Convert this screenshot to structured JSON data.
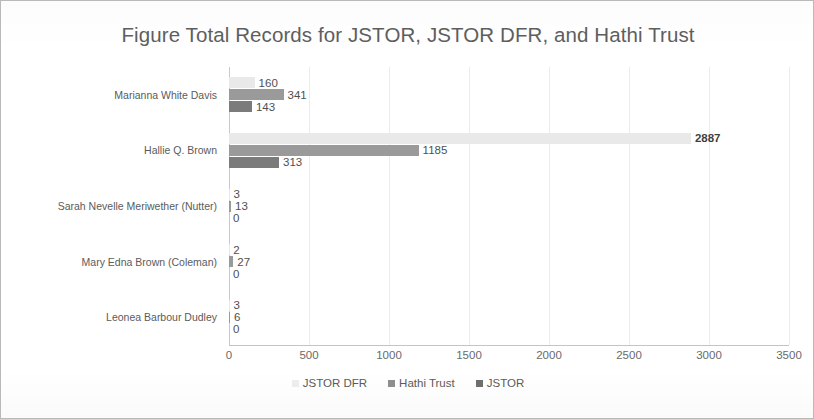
{
  "chart_data": {
    "type": "bar",
    "orientation": "horizontal",
    "title": "Figure Total Records for JSTOR, JSTOR DFR, and Hathi Trust",
    "xlabel": "",
    "ylabel": "",
    "xlim": [
      0,
      3500
    ],
    "xticks": [
      0,
      500,
      1000,
      1500,
      2000,
      2500,
      3000,
      3500
    ],
    "xtick_labels": [
      "0",
      "500",
      "1000",
      "1500",
      "2000",
      "2500",
      "3000",
      "3500"
    ],
    "grid": true,
    "legend_position": "bottom",
    "categories": [
      "Marianna White Davis",
      "Hallie Q. Brown",
      "Sarah Nevelle Meriwether (Nutter)",
      "Mary Edna Brown (Coleman)",
      "Leonea Barbour Dudley"
    ],
    "series": [
      {
        "name": "JSTOR DFR",
        "color": "#e9e9e9",
        "values": [
          160,
          2887,
          3,
          2,
          3
        ],
        "labels": [
          "160",
          "2887",
          "3",
          "2",
          "3"
        ]
      },
      {
        "name": "Hathi Trust",
        "color": "#9a9a9a",
        "values": [
          341,
          1185,
          13,
          27,
          6
        ],
        "labels": [
          "341",
          "1185",
          "13",
          "27",
          "6"
        ]
      },
      {
        "name": "JSTOR",
        "color": "#7b7b7b",
        "values": [
          143,
          313,
          0,
          0,
          0
        ],
        "labels": [
          "143",
          "313",
          "0",
          "0",
          "0"
        ]
      }
    ]
  },
  "legend": {
    "items": [
      {
        "label": "JSTOR DFR",
        "swatch": "s-dfr"
      },
      {
        "label": "Hathi Trust",
        "swatch": "s-hathi"
      },
      {
        "label": "JSTOR",
        "swatch": "s-jstor"
      }
    ]
  }
}
